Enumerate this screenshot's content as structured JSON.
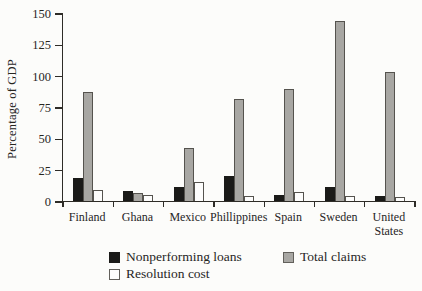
{
  "chart_data": {
    "type": "bar",
    "title": "",
    "ylabel": "Percentage of GDP",
    "xlabel": "",
    "ylim": [
      0,
      150
    ],
    "yticks": [
      0,
      25,
      50,
      75,
      100,
      125,
      150
    ],
    "grid": false,
    "legend_position": "bottom",
    "categories": [
      "Finland",
      "Ghana",
      "Mexico",
      "Phillippines",
      "Spain",
      "Sweden",
      "United States"
    ],
    "series": [
      {
        "name": "Nonperforming loans",
        "color": "#1a1a18",
        "border": "#1a1a18",
        "values": [
          18,
          8,
          11,
          20,
          5,
          11,
          4
        ]
      },
      {
        "name": "Total claims",
        "color": "#a8a7a3",
        "border": "#55534e",
        "values": [
          87,
          6,
          42,
          81,
          89,
          144,
          103
        ]
      },
      {
        "name": "Resolution cost",
        "color": "#fdfdfc",
        "border": "#55534e",
        "values": [
          9,
          5,
          15,
          4,
          7,
          4,
          3
        ]
      }
    ]
  },
  "axis_colors": {
    "line": "#2e2c27",
    "text": "#27251f"
  },
  "background_color": "#fcfcfa"
}
